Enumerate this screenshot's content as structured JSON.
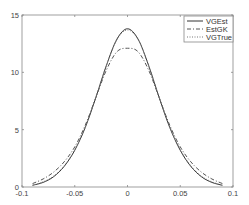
{
  "chart_data": {
    "type": "line",
    "title": "",
    "xlabel": "",
    "ylabel": "",
    "xlim": [
      -0.1,
      0.1
    ],
    "ylim": [
      0,
      15
    ],
    "xticks": [
      -0.1,
      -0.05,
      0,
      0.05,
      0.1
    ],
    "xtick_labels": [
      "-0.1",
      "-0.05",
      "0",
      "0.05",
      "0.1"
    ],
    "yticks": [
      0,
      5,
      10,
      15
    ],
    "ytick_labels": [
      "0",
      "5",
      "10",
      "15"
    ],
    "grid": false,
    "legend_position": "top-right",
    "series": [
      {
        "name": "VGEst",
        "style": "solid",
        "color": "#333333",
        "x": [
          -0.09,
          -0.08,
          -0.07,
          -0.06,
          -0.05,
          -0.04,
          -0.03,
          -0.02,
          -0.01,
          0,
          0.01,
          0.02,
          0.03,
          0.04,
          0.05,
          0.06,
          0.07,
          0.08,
          0.09
        ],
        "y": [
          0.15,
          0.4,
          0.9,
          1.8,
          3.2,
          5.2,
          7.8,
          10.6,
          12.9,
          13.8,
          12.9,
          10.6,
          7.8,
          5.2,
          3.2,
          1.8,
          0.9,
          0.4,
          0.15
        ]
      },
      {
        "name": "EstGK",
        "style": "dashdot",
        "color": "#555555",
        "x": [
          -0.09,
          -0.08,
          -0.07,
          -0.06,
          -0.05,
          -0.04,
          -0.03,
          -0.02,
          -0.01,
          0,
          0.01,
          0.02,
          0.03,
          0.04,
          0.05,
          0.06,
          0.07,
          0.08,
          0.09
        ],
        "y": [
          0.3,
          0.7,
          1.3,
          2.2,
          3.5,
          5.4,
          7.8,
          10.2,
          11.8,
          12.1,
          11.8,
          10.2,
          7.8,
          5.4,
          3.5,
          2.2,
          1.3,
          0.7,
          0.3
        ]
      },
      {
        "name": "VGTrue",
        "style": "dotted",
        "color": "#777777",
        "x": [
          -0.09,
          -0.08,
          -0.07,
          -0.06,
          -0.05,
          -0.04,
          -0.03,
          -0.02,
          -0.01,
          0,
          0.01,
          0.02,
          0.03,
          0.04,
          0.05,
          0.06,
          0.07,
          0.08,
          0.09
        ],
        "y": [
          0.15,
          0.45,
          0.95,
          1.85,
          3.25,
          5.25,
          7.85,
          10.6,
          12.85,
          13.7,
          12.85,
          10.6,
          7.85,
          5.25,
          3.25,
          1.85,
          0.95,
          0.45,
          0.15
        ]
      }
    ]
  }
}
